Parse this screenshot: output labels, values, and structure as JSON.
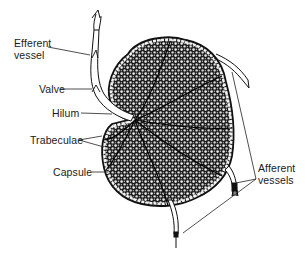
{
  "diagram": {
    "colors": {
      "ink": "#111111",
      "background": "#ffffff",
      "vessel_fill": "#ffffff"
    },
    "labels": {
      "efferent_vessel_line1": "Efferent",
      "efferent_vessel_line2": "vessel",
      "valve": "Valve",
      "hilum": "Hilum",
      "trabeculae": "Trabeculae",
      "capsule": "Capsule",
      "afferent_vessels_line1": "Afferent",
      "afferent_vessels_line2": "vessels"
    }
  }
}
